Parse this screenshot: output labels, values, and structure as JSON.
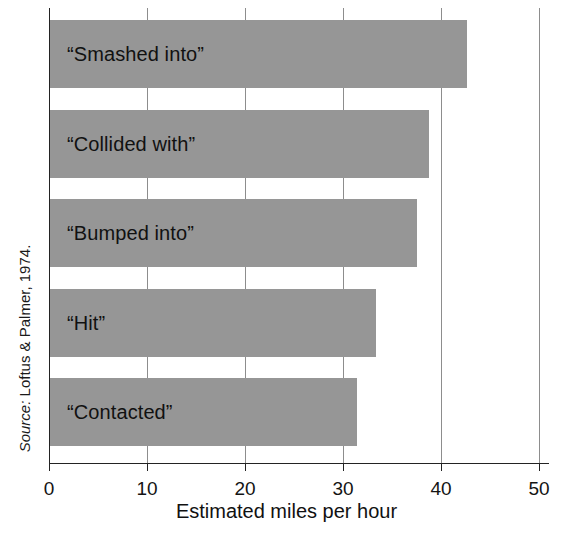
{
  "figure": {
    "source_prefix": "Source:",
    "source_text": " Loftus & Palmer, 1974.",
    "title_fragment": "y"
  },
  "axis": {
    "x_title": "Estimated miles per hour",
    "tick_labels": [
      "0",
      "10",
      "20",
      "30",
      "40",
      "50"
    ]
  },
  "chart_data": {
    "type": "bar",
    "orientation": "horizontal",
    "title": "",
    "xlabel": "Estimated miles per hour",
    "ylabel": "",
    "xlim": [
      0,
      50
    ],
    "ticks": [
      0,
      10,
      20,
      30,
      40,
      50
    ],
    "grid": true,
    "legend": null,
    "bar_color": "#969696",
    "categories": [
      "“Smashed into”",
      "“Collided with”",
      "“Bumped into”",
      "“Hit”",
      "“Contacted”"
    ],
    "values": [
      42.5,
      38.7,
      37.4,
      33.3,
      31.3
    ],
    "source": "Source: Loftus & Palmer, 1974."
  }
}
